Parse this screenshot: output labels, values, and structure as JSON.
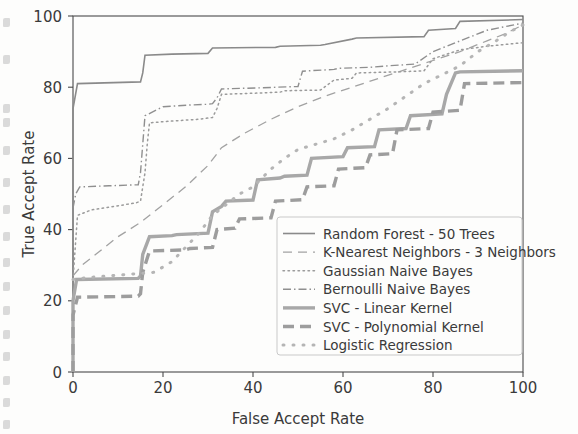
{
  "figure": {
    "background_color": "#fdfdfc",
    "axis_color": "#4a4a4a",
    "text_color": "#3a3a3a"
  },
  "chart_data": {
    "type": "line",
    "title": "",
    "xlabel": "False Accept Rate",
    "ylabel": "True Accept Rate",
    "xlim": [
      0,
      100
    ],
    "ylim": [
      0,
      100
    ],
    "xticks": [
      0,
      20,
      40,
      60,
      80,
      100
    ],
    "yticks": [
      0,
      20,
      40,
      60,
      80,
      100
    ],
    "xtick_labels": [
      "0",
      "20",
      "40",
      "60",
      "80",
      "100"
    ],
    "ytick_labels": [
      "0",
      "20",
      "40",
      "60",
      "80",
      "100"
    ],
    "grid": false,
    "legend_position": "lower right",
    "series": [
      {
        "name": "Random Forest - 50 Trees",
        "style": "solid",
        "linewidth": 1.6,
        "color": "#8a8a8a",
        "dasharray": "",
        "x": [
          0,
          0,
          1,
          15,
          15.5,
          16,
          22,
          30,
          31,
          45,
          46,
          55,
          56,
          62,
          63,
          78,
          79,
          85,
          86,
          100
        ],
        "y": [
          0,
          74,
          81,
          81.5,
          84,
          89,
          89.3,
          89.5,
          91,
          91.2,
          91.5,
          91.8,
          92,
          93.5,
          93.8,
          94.2,
          96,
          96.5,
          98.5,
          99
        ]
      },
      {
        "name": "K-Nearest Neighbors - 3 Neighbors",
        "style": "dashed",
        "linewidth": 1.3,
        "color": "#a2a2a2",
        "dasharray": "9 6",
        "x": [
          0,
          2,
          6,
          10,
          15,
          20,
          25,
          30,
          33,
          38,
          44,
          50,
          56,
          62,
          68,
          74,
          80,
          86,
          92,
          96,
          100
        ],
        "y": [
          27,
          30,
          34,
          38,
          42,
          47,
          52,
          58,
          63,
          67,
          71,
          74.5,
          77.5,
          80,
          82.5,
          85,
          87.5,
          90,
          93,
          95,
          97.5
        ]
      },
      {
        "name": "Gaussian Naive Bayes",
        "style": "dotted",
        "linewidth": 1.5,
        "color": "#9b9b9b",
        "dasharray": "1.5 3.5",
        "x": [
          0,
          1,
          4,
          9,
          14,
          15,
          16,
          16.5,
          17,
          22,
          28,
          31,
          32,
          33,
          40,
          46,
          47,
          55,
          58,
          62,
          63,
          72,
          78,
          80,
          86,
          92,
          100
        ],
        "y": [
          26,
          44,
          45.5,
          46.5,
          47.5,
          48,
          56,
          64,
          70,
          70.5,
          71,
          71.5,
          74,
          78,
          78.3,
          78.6,
          79,
          79.2,
          82,
          82.5,
          84,
          84.3,
          84.6,
          88,
          90.5,
          91.5,
          92.5
        ]
      },
      {
        "name": "Bernoulli Naive Bayes",
        "style": "dashdot",
        "linewidth": 1.4,
        "color": "#8f8f8f",
        "dasharray": "8 3 1.5 3",
        "x": [
          0,
          0.6,
          1.5,
          8,
          14.5,
          15,
          15.5,
          16,
          20,
          26,
          30,
          31,
          32,
          33,
          38,
          44,
          45,
          50,
          51,
          58,
          59,
          66,
          70,
          76,
          80,
          86,
          92,
          100
        ],
        "y": [
          46,
          50,
          52,
          52.3,
          52.6,
          56,
          64,
          72,
          74.5,
          75,
          75.2,
          75.4,
          77,
          79.5,
          79.7,
          79.9,
          80,
          80.2,
          84.5,
          85,
          85.3,
          85.6,
          86,
          86.5,
          90,
          93,
          96,
          98
        ]
      },
      {
        "name": "SVC - Linear Kernel",
        "style": "solid",
        "linewidth": 3.4,
        "color": "#a8a8a8",
        "dasharray": "",
        "x": [
          0,
          0,
          0.8,
          14.5,
          15,
          15.5,
          17,
          22,
          23,
          30,
          31,
          33,
          34,
          40,
          41,
          46,
          47,
          52,
          53,
          60,
          61,
          67,
          68,
          74,
          75,
          82,
          83,
          85,
          86,
          100
        ],
        "y": [
          0,
          20,
          26,
          26.3,
          27,
          33,
          38,
          38.3,
          38.6,
          39,
          45,
          46.5,
          48,
          48.3,
          54,
          54.5,
          55,
          55.3,
          60,
          60.5,
          63,
          63.3,
          68,
          68.4,
          72,
          72.5,
          78,
          84,
          84.3,
          84.6
        ]
      },
      {
        "name": "SVC - Polynomial Kernel",
        "style": "dashed",
        "linewidth": 3.4,
        "color": "#9d9d9d",
        "dasharray": "11 6",
        "x": [
          0,
          0,
          1,
          14.5,
          15,
          15.5,
          17,
          25,
          26,
          31,
          32,
          36,
          37,
          44,
          45,
          51,
          52,
          58,
          59,
          65,
          66,
          71,
          72,
          79,
          80,
          86,
          87,
          100
        ],
        "y": [
          0,
          16,
          21,
          21.3,
          22,
          28,
          34,
          34.3,
          34.7,
          35,
          40,
          40.4,
          43,
          43.3,
          48,
          48.4,
          52,
          52.3,
          57,
          57.4,
          61,
          61.3,
          68,
          68.4,
          73,
          73.5,
          81,
          81.3
        ]
      },
      {
        "name": "Logistic Regression",
        "style": "dotted",
        "linewidth": 3.0,
        "color": "#b5b5b5",
        "dasharray": "1 9",
        "x": [
          0,
          3,
          8,
          13,
          18,
          22,
          25,
          28,
          31,
          34,
          37,
          40,
          44,
          47,
          50,
          54,
          58,
          62,
          66,
          70,
          74,
          78,
          82,
          86,
          90,
          94,
          97,
          100
        ],
        "y": [
          26,
          26.5,
          27,
          27.5,
          28,
          31,
          35,
          39,
          44,
          47,
          50,
          52,
          57,
          60,
          62.5,
          64,
          65.5,
          68,
          71,
          74,
          77.5,
          81,
          83.5,
          86,
          90,
          93,
          95.5,
          97.5
        ]
      }
    ]
  },
  "legend": {
    "entries": [
      {
        "label": "Random Forest - 50 Trees"
      },
      {
        "label": "K-Nearest Neighbors - 3 Neighbors"
      },
      {
        "label": "Gaussian Naive Bayes"
      },
      {
        "label": "Bernoulli Naive Bayes"
      },
      {
        "label": "SVC - Linear Kernel"
      },
      {
        "label": "SVC - Polynomial Kernel"
      },
      {
        "label": "Logistic Regression"
      }
    ]
  }
}
